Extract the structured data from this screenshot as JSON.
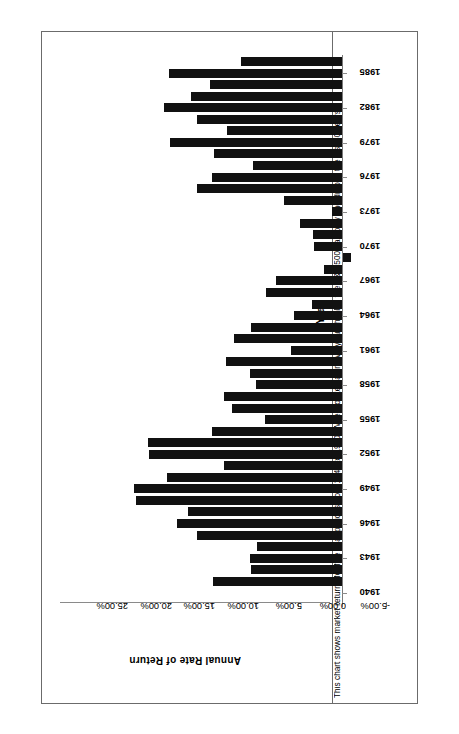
{
  "title": {
    "figure_number": "Figure 5.3",
    "text": "S&P Return Within Five Year Increments 1941-1990"
  },
  "caption": "This chart shows market returns for five year periods from 1941 to 1990.  When looked at in five year chunks, the S&P 500 had only one drop in the last 50 years.",
  "axis_titles": {
    "category": "Year",
    "value": "Annual  Rate  of  Return"
  },
  "chart_data": {
    "type": "bar",
    "orientation": "horizontal",
    "xlabel": "Annual Rate of Return",
    "ylabel": "Year",
    "xlim": [
      -5.0,
      25.0
    ],
    "grid": false,
    "legend": null,
    "value_ticks": [
      25.0,
      20.0,
      15.0,
      10.0,
      5.0,
      0.0,
      -5.0
    ],
    "value_tick_labels": [
      "25.00%",
      "20.00%",
      "15.00%",
      "10.00%",
      "5.00%",
      "0.00%",
      "-5.00%"
    ],
    "category_ticks": [
      1940,
      1943,
      1946,
      1949,
      1952,
      1955,
      1958,
      1961,
      1964,
      1967,
      1970,
      1973,
      1976,
      1979,
      1982,
      1985,
      1988
    ],
    "categories": [
      1941,
      1942,
      1943,
      1944,
      1945,
      1946,
      1947,
      1948,
      1949,
      1950,
      1951,
      1952,
      1953,
      1954,
      1955,
      1956,
      1957,
      1958,
      1959,
      1960,
      1961,
      1962,
      1963,
      1964,
      1965,
      1966,
      1967,
      1968,
      1969,
      1970,
      1971,
      1972,
      1973,
      1974,
      1975,
      1976,
      1977,
      1978,
      1979,
      1980,
      1981,
      1982,
      1983,
      1984,
      1985,
      1986
    ],
    "values": [
      7.7,
      17.3,
      17.1,
      9.3,
      9.4,
      4.7,
      10.0,
      12.9,
      18.0,
      20.2,
      19.1,
      14.6,
      14.8,
      23.0,
      22.1,
      13.1,
      13.8,
      10.6,
      8.7,
      12.7,
      11.6,
      9.4,
      9.2,
      5.5,
      6.2,
      3.4,
      4.9,
      2.1,
      -0.9,
      3.3,
      4.8,
      1.1,
      6.7,
      11.1,
      16.6,
      14.9,
      10.2,
      14.7,
      19.8,
      13.2,
      16.6,
      20.4,
      17.3,
      15.2,
      19.9,
      11.6
    ]
  },
  "bars": [
    {
      "year": 1986,
      "value": 11.6,
      "left": 166.7
    },
    {
      "year": 1985,
      "value": 19.9,
      "left": 104.0
    },
    {
      "year": 1984,
      "value": 15.2,
      "left": 149.3
    },
    {
      "year": 1983,
      "value": 17.3,
      "left": 139.0
    },
    {
      "year": 1982,
      "value": 20.4,
      "left": 109.3
    },
    {
      "year": 1981,
      "value": 16.6,
      "left": 153.3
    },
    {
      "year": 1980,
      "value": 13.2,
      "left": 153.3
    },
    {
      "year": 1979,
      "value": 19.8,
      "left": 131.7
    },
    {
      "year": 1978,
      "value": 14.7,
      "left": 160.0
    },
    {
      "year": 1977,
      "value": 10.2,
      "left": 212.0
    },
    {
      "year": 1976,
      "value": 14.9,
      "left": 161.7
    },
    {
      "year": 1975,
      "value": 16.6,
      "left": 152.3
    },
    {
      "year": 1974,
      "value": 6.7,
      "left": 245.0
    },
    {
      "year": 1973,
      "value": 1.1,
      "left": 281.0
    },
    {
      "year": 1972,
      "value": 4.8,
      "left": 239.3
    },
    {
      "year": 1971,
      "value": 3.3,
      "left": 253.3
    },
    {
      "year": 1970,
      "value": 3.2,
      "left": 254.3
    },
    {
      "year": 1969,
      "value": -0.9,
      "left": 283.0
    },
    {
      "year": 1968,
      "value": 2.1,
      "left": 265.0
    },
    {
      "year": 1967,
      "value": 7.6,
      "left": 217.3
    },
    {
      "year": 1966,
      "value": 8.7,
      "left": 207.7
    },
    {
      "year": 1965,
      "value": 3.4,
      "left": 252.7
    },
    {
      "year": 1964,
      "value": 5.5,
      "left": 238.3
    },
    {
      "year": 1963,
      "value": 10.4,
      "left": 192.7
    },
    {
      "year": 1962,
      "value": 12.4,
      "left": 175.0
    },
    {
      "year": 1961,
      "value": 5.8,
      "left": 232.7
    },
    {
      "year": 1960,
      "value": 13.3,
      "left": 167.3
    },
    {
      "year": 1959,
      "value": 10.6,
      "left": 190.7
    },
    {
      "year": 1958,
      "value": 9.9,
      "left": 197.3
    },
    {
      "year": 1957,
      "value": 13.5,
      "left": 166.0
    },
    {
      "year": 1956,
      "value": 12.6,
      "left": 173.3
    },
    {
      "year": 1955,
      "value": 8.8,
      "left": 206.7
    },
    {
      "year": 1954,
      "value": 14.9,
      "left": 152.7
    },
    {
      "year": 1953,
      "value": 22.3,
      "left": 88.3
    },
    {
      "year": 1952,
      "value": 22.2,
      "left": 89.3
    },
    {
      "year": 1951,
      "value": 13.6,
      "left": 165.0
    },
    {
      "year": 1950,
      "value": 20.1,
      "left": 108.3
    },
    {
      "year": 1949,
      "value": 23.9,
      "left": 75.0
    },
    {
      "year": 1948,
      "value": 23.7,
      "left": 76.7
    },
    {
      "year": 1947,
      "value": 17.7,
      "left": 128.3
    },
    {
      "year": 1946,
      "value": 18.9,
      "left": 117.3
    },
    {
      "year": 1945,
      "value": 16.6,
      "left": 137.7
    },
    {
      "year": 1944,
      "value": 9.8,
      "left": 197.3
    },
    {
      "year": 1943,
      "value": 10.6,
      "left": 190.0
    },
    {
      "year": 1942,
      "value": 10.5,
      "left": 191.0
    },
    {
      "year": 1941,
      "value": 14.8,
      "left": 153.3
    }
  ],
  "extra_bars": [
    {
      "year": 1940,
      "value": 17.7,
      "left": 128.3
    },
    {
      "year": 1939,
      "value": 16.8,
      "left": 136.7
    },
    {
      "year": 1938,
      "value": 7.6,
      "left": 216.7
    }
  ]
}
